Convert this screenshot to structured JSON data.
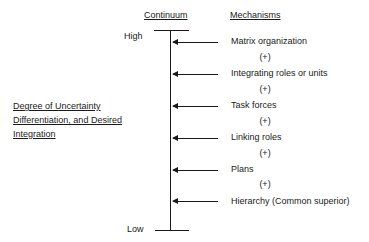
{
  "headers": {
    "continuum": "Continuum",
    "mechanisms": "Mechanisms"
  },
  "scale": {
    "high": "High",
    "low": "Low"
  },
  "axis_label": {
    "line1": "Degree of Uncertainty",
    "line2": "Differentiation, and Desired",
    "line3": "Integration"
  },
  "mechanisms": [
    {
      "label": "Matrix organization"
    },
    {
      "label": "Integrating roles or units"
    },
    {
      "label": "Task forces"
    },
    {
      "label": "Linking roles"
    },
    {
      "label": "Plans"
    },
    {
      "label": "Hierarchy (Common superior)"
    }
  ],
  "separator": "(+)"
}
